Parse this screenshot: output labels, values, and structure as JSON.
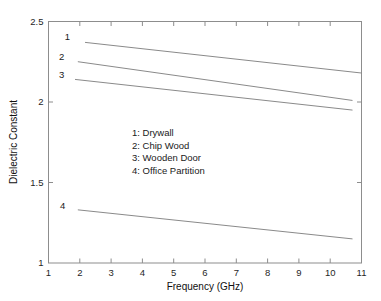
{
  "chart_data": {
    "type": "line",
    "title": "",
    "xlabel": "Frequency (GHz)",
    "ylabel": "Dielectric Constant",
    "xlim": [
      1,
      11
    ],
    "ylim": [
      1,
      2.5
    ],
    "xticks": [
      1,
      2,
      3,
      4,
      5,
      6,
      7,
      8,
      9,
      10,
      11
    ],
    "xtick_labels": [
      "1",
      "2",
      "3",
      "4",
      "5",
      "6",
      "7",
      "8",
      "9",
      "10",
      "11"
    ],
    "yticks": [
      1,
      1.5,
      2,
      2.5
    ],
    "ytick_labels": [
      "1",
      "1.5",
      "2",
      "2.5"
    ],
    "grid": false,
    "legend_position": "center",
    "legend_entries": [
      "1: Drywall",
      "2: Chip Wood",
      "3: Wooden Door",
      "4: Office Partition"
    ],
    "series": [
      {
        "name": "Drywall",
        "tag": "1",
        "x": [
          2.18,
          11.0
        ],
        "values": [
          2.37,
          2.18
        ]
      },
      {
        "name": "Chip Wood",
        "tag": "2",
        "x": [
          1.95,
          10.7
        ],
        "values": [
          2.25,
          2.01
        ]
      },
      {
        "name": "Wooden Door",
        "tag": "3",
        "x": [
          1.86,
          10.7
        ],
        "values": [
          2.14,
          1.95
        ]
      },
      {
        "name": "Office Partition",
        "tag": "4",
        "x": [
          1.95,
          10.7
        ],
        "values": [
          1.33,
          1.15
        ]
      }
    ],
    "curve_tags": [
      {
        "label": "1",
        "x": 1.6,
        "y": 2.405
      },
      {
        "label": "2",
        "x": 1.42,
        "y": 2.28
      },
      {
        "label": "3",
        "x": 1.42,
        "y": 2.17
      },
      {
        "label": "4",
        "x": 1.45,
        "y": 1.355
      }
    ],
    "colors": {
      "line": "#8a8a8a",
      "axis": "#8d8d8d",
      "text": "#1a1a1a",
      "background": "#ffffff"
    }
  }
}
